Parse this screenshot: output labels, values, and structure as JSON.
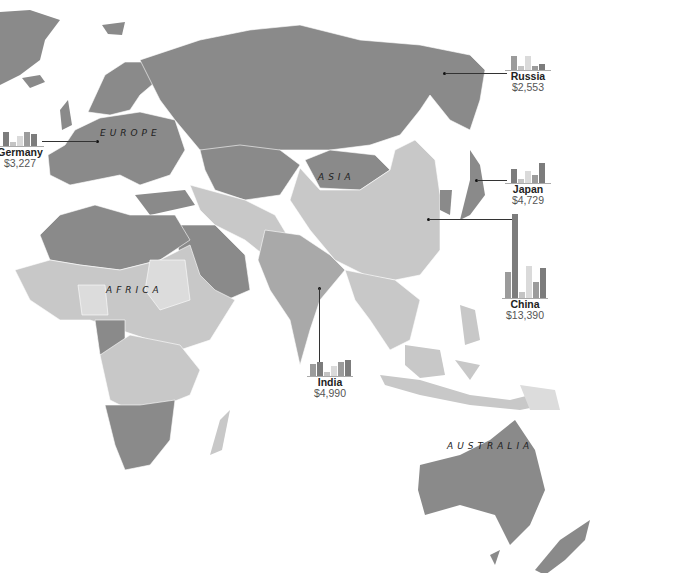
{
  "regions": [
    {
      "label": "EUROPE",
      "x": 100,
      "y": 128
    },
    {
      "label": "ASIA",
      "x": 318,
      "y": 172
    },
    {
      "label": "AFRICA",
      "x": 106,
      "y": 285
    },
    {
      "label": "AUSTRALIA",
      "x": 447,
      "y": 441
    }
  ],
  "colors": {
    "dark": "#8a8a8a",
    "medium": "#a9a9a9",
    "light": "#c8c8c8",
    "lightest": "#dcdcdc",
    "bar_dark": "#7c7c7c",
    "bar_mid": "#9b9b9b",
    "bar_light": "#c4c4c4",
    "bar_lightest": "#dadada"
  },
  "callouts": {
    "russia": {
      "name": "Russia",
      "value": "$2,553",
      "bars": [
        14,
        4,
        14,
        4,
        6
      ]
    },
    "germany": {
      "name": "Germany",
      "value": "$3,227",
      "bars": [
        14,
        4,
        10,
        14,
        12
      ]
    },
    "japan": {
      "name": "Japan",
      "value": "$4,729",
      "bars": [
        14,
        4,
        12,
        8,
        20
      ]
    },
    "china": {
      "name": "China",
      "value": "$13,390",
      "bars": [
        26,
        84,
        6,
        32,
        16,
        30
      ]
    },
    "india": {
      "name": "India",
      "value": "$4,990",
      "bars": [
        12,
        14,
        4,
        10,
        14,
        16
      ]
    }
  }
}
